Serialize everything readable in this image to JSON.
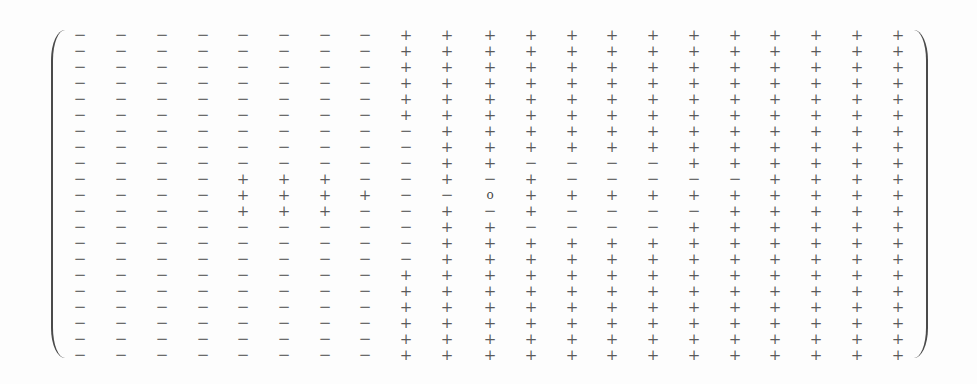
{
  "matrix": {
    "rows": 21,
    "cols": 21,
    "glyphs": {
      "+": "+",
      "-": "−",
      "0": "o"
    },
    "layout": {
      "col_x": [
        80,
        121,
        162,
        203,
        243,
        284,
        325,
        365,
        406,
        447,
        490,
        531,
        572,
        612,
        653,
        694,
        735,
        775,
        816,
        857,
        898
      ],
      "row_y": [
        35,
        51,
        67,
        83,
        99,
        115,
        131,
        147,
        163,
        179,
        195,
        211,
        227,
        243,
        259,
        275,
        291,
        307,
        323,
        339,
        355
      ]
    },
    "cells": [
      "--------+++++++++++++",
      "--------+++++++++++++",
      "--------+++++++++++++",
      "--------+++++++++++++",
      "--------+++++++++++++",
      "--------+++++++++++++",
      "---------++++++++++++",
      "---------++++++++++++",
      "---------++----++++++",
      "----+++--+-+-----+++++",
      "----++++--0++++++++++",
      "----+++--+-+----+++++",
      "---------++----++++++",
      "---------++++++++++++",
      "---------++++++++++++",
      "--------+++++++++++++",
      "--------+++++++++++++",
      "--------+++++++++++++",
      "--------+++++++++++++",
      "--------+++++++++++++",
      "--------+++++++++++++"
    ],
    "center_symbol": "o"
  }
}
